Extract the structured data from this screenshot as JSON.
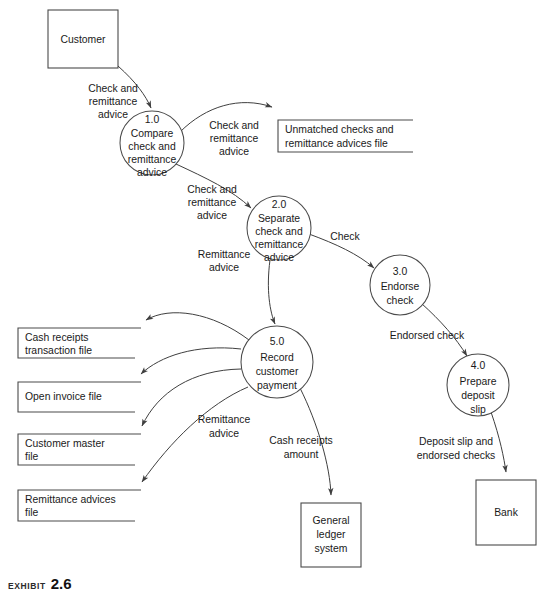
{
  "diagram": {
    "type": "data-flow-diagram",
    "caption": {
      "kicker": "Exhibit",
      "number": "2.6",
      "subtitle": ""
    },
    "colors": {
      "stroke": "#4a4a4a",
      "flow_stroke": "#3f3f3f",
      "text": "#1a1a1a",
      "background": "#ffffff"
    },
    "external_entities": [
      {
        "id": "customer",
        "label": "Customer",
        "x": 48,
        "y": 10,
        "w": 70,
        "h": 58
      },
      {
        "id": "general-ledger-system",
        "label_lines": [
          "General",
          "ledger",
          "system"
        ],
        "x": 301,
        "y": 503,
        "w": 60,
        "h": 64
      },
      {
        "id": "bank",
        "label_lines": [
          "Bank"
        ],
        "x": 476,
        "y": 480,
        "w": 60,
        "h": 65
      }
    ],
    "processes": [
      {
        "id": "process-1",
        "number": "1.0",
        "label_lines": [
          "Compare",
          "check and",
          "remittance",
          "advice"
        ],
        "cx": 152,
        "cy": 143,
        "r": 32
      },
      {
        "id": "process-2",
        "number": "2.0",
        "label_lines": [
          "Separate",
          "check and",
          "remittance",
          "advice"
        ],
        "cx": 279,
        "cy": 228,
        "r": 32
      },
      {
        "id": "process-3",
        "number": "3.0",
        "label_lines": [
          "Endorse",
          "check"
        ],
        "cx": 400,
        "cy": 285,
        "r": 30
      },
      {
        "id": "process-4",
        "number": "4.0",
        "label_lines": [
          "Prepare",
          "deposit",
          "slip"
        ],
        "cx": 478,
        "cy": 385,
        "r": 31
      },
      {
        "id": "process-5",
        "number": "5.0",
        "label_lines": [
          "Record",
          "customer",
          "payment"
        ],
        "cx": 277,
        "cy": 362,
        "r": 36
      }
    ],
    "data_stores": [
      {
        "id": "unmatched-checks-file",
        "label_lines": [
          "Unmatched checks and",
          "remittance advices file"
        ],
        "x": 278,
        "y": 120,
        "w": 135,
        "h": 32,
        "orientation": "open-right"
      },
      {
        "id": "cash-receipts-transaction-file",
        "label_lines": [
          "Cash receipts",
          "transaction file"
        ],
        "x": 18,
        "y": 328,
        "w": 117,
        "h": 30,
        "orientation": "open-right"
      },
      {
        "id": "open-invoice-file",
        "label_lines": [
          "Open invoice file"
        ],
        "x": 18,
        "y": 382,
        "w": 117,
        "h": 30,
        "orientation": "open-right"
      },
      {
        "id": "customer-master-file",
        "label_lines": [
          "Customer master",
          "file"
        ],
        "x": 18,
        "y": 434,
        "w": 117,
        "h": 31,
        "orientation": "open-right"
      },
      {
        "id": "remittance-advices-file",
        "label_lines": [
          "Remittance advices",
          "file"
        ],
        "x": 18,
        "y": 490,
        "w": 117,
        "h": 31,
        "orientation": "open-right"
      }
    ],
    "data_flows": [
      {
        "id": "flow-customer-to-p1",
        "label_lines": [
          "Check and",
          "remittance",
          "advice"
        ],
        "from": "customer",
        "to": "process-1",
        "label_x": 113,
        "label_y": 96
      },
      {
        "id": "flow-p1-to-unmatched",
        "label_lines": [
          "Check and",
          "remittance",
          "advice"
        ],
        "from": "process-1",
        "to": "unmatched-checks-file",
        "label_x": 234,
        "label_y": 132
      },
      {
        "id": "flow-p1-to-p2",
        "label_lines": [
          "Check and",
          "remittance",
          "advice"
        ],
        "from": "process-1",
        "to": "process-2",
        "label_x": 212,
        "label_y": 196
      },
      {
        "id": "flow-p2-to-p3",
        "label_lines": [
          "Check"
        ],
        "from": "process-2",
        "to": "process-3",
        "label_x": 345,
        "label_y": 237
      },
      {
        "id": "flow-p2-to-p5",
        "label_lines": [
          "Remittance",
          "advice"
        ],
        "from": "process-2",
        "to": "process-5",
        "label_x": 224,
        "label_y": 261
      },
      {
        "id": "flow-p3-to-p4",
        "label_lines": [
          "Endorsed check"
        ],
        "from": "process-3",
        "to": "process-4",
        "label_x": 427,
        "label_y": 336
      },
      {
        "id": "flow-p4-to-bank",
        "label_lines": [
          "Deposit slip and",
          "endorsed checks"
        ],
        "from": "process-4",
        "to": "bank",
        "label_x": 456,
        "label_y": 446
      },
      {
        "id": "flow-p5-to-cash-receipts",
        "label_lines": [],
        "from": "process-5",
        "to": "cash-receipts-transaction-file",
        "label_x": 0,
        "label_y": 0
      },
      {
        "id": "flow-p5-to-open-invoice",
        "label_lines": [],
        "from": "process-5",
        "to": "open-invoice-file",
        "label_x": 0,
        "label_y": 0
      },
      {
        "id": "flow-p5-to-customer-master",
        "label_lines": [],
        "from": "process-5",
        "to": "customer-master-file",
        "label_x": 0,
        "label_y": 0
      },
      {
        "id": "flow-p5-to-remittance-advices",
        "label_lines": [
          "Remittance",
          "advice"
        ],
        "from": "process-5",
        "to": "remittance-advices-file",
        "label_x": 224,
        "label_y": 420
      },
      {
        "id": "flow-p5-to-gl",
        "label_lines": [
          "Cash receipts",
          "amount"
        ],
        "from": "process-5",
        "to": "general-ledger-system",
        "label_x": 301,
        "label_y": 443
      }
    ]
  }
}
